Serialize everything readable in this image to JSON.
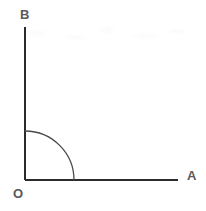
{
  "figure": {
    "background_color": "#ffffff",
    "width": 206,
    "height": 211,
    "axis_color": "#2b2b2b",
    "arc_color": "#4a4a4a",
    "label_color": "#5a5a5a",
    "axis_stroke_width": 2,
    "arc_stroke_width": 1.3
  },
  "geometry": {
    "origin": {
      "x": 25,
      "y": 180
    },
    "vertical_ray": {
      "x1": 25,
      "y1": 180,
      "x2": 25,
      "y2": 27
    },
    "horizontal_ray": {
      "x1": 25,
      "y1": 180,
      "x2": 178,
      "y2": 180
    },
    "arc": {
      "center_x": 25,
      "center_y": 180,
      "radius": 49,
      "start_angle_deg": 90,
      "end_angle_deg": 0,
      "sweep_deg": 90
    },
    "angle_measure_deg": 90
  },
  "labels": {
    "vertical_endpoint": "B",
    "origin": "O",
    "horizontal_endpoint": "A"
  }
}
